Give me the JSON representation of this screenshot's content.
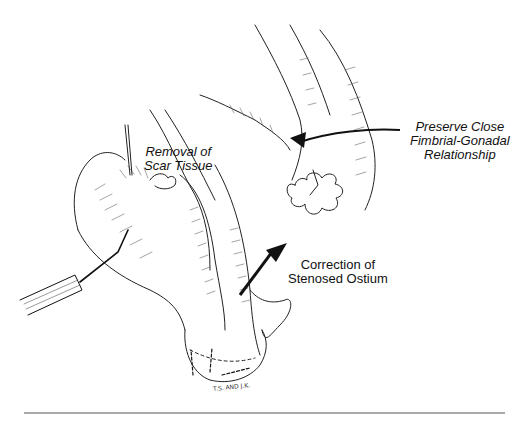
{
  "figure": {
    "type": "surgical illustration",
    "labels": {
      "scar_removal": [
        "Removal of",
        "Scar Tissue"
      ],
      "fimbrial": [
        "Preserve Close",
        "Fimbrial-Gonadal",
        "Relationship"
      ],
      "ostium": [
        "Correction of",
        "Stenosed Ostium"
      ]
    },
    "signature": "T.S. AND J.K.",
    "colors": {
      "ink": "#111111",
      "background": "#ffffff",
      "rule": "#555555"
    }
  }
}
